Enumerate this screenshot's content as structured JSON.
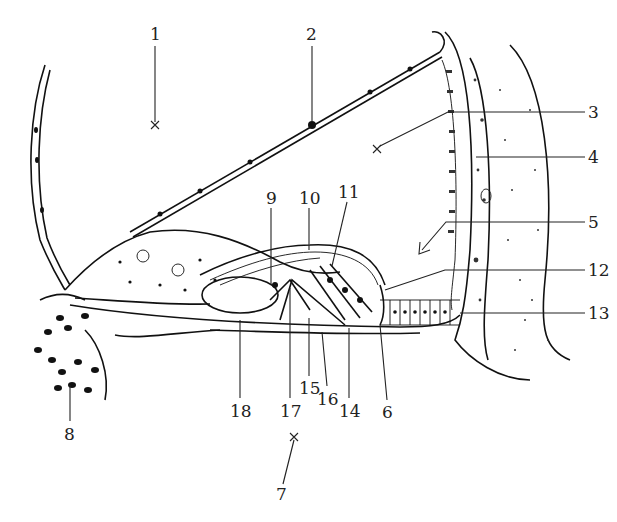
{
  "figure": {
    "background": "#ffffff",
    "ink_color": "#111111",
    "labels": [
      {
        "id": "1",
        "text": "1",
        "x": 155,
        "y": 38,
        "target": [
          155,
          125
        ],
        "marker": "x"
      },
      {
        "id": "2",
        "text": "2",
        "x": 312,
        "y": 38,
        "target": [
          312,
          125
        ],
        "marker": "none"
      },
      {
        "id": "3",
        "text": "3",
        "x": 595,
        "y": 118,
        "target": [
          377,
          148
        ],
        "marker": "x"
      },
      {
        "id": "4",
        "text": "4",
        "x": 595,
        "y": 161,
        "target": [
          478,
          160
        ],
        "marker": "none"
      },
      {
        "id": "5",
        "text": "5",
        "x": 595,
        "y": 226,
        "target": [
          420,
          253
        ],
        "marker": "arrow"
      },
      {
        "id": "6",
        "text": "6",
        "x": 389,
        "y": 418,
        "target": [
          380,
          320
        ],
        "marker": "none"
      },
      {
        "id": "7",
        "text": "7",
        "x": 280,
        "y": 498,
        "target": [
          295,
          436
        ],
        "marker": "x"
      },
      {
        "id": "8",
        "text": "8",
        "x": 70,
        "y": 437,
        "target": [
          70,
          380
        ],
        "marker": "none"
      },
      {
        "id": "9",
        "text": "9",
        "x": 271,
        "y": 202,
        "target": [
          271,
          285
        ],
        "marker": "none"
      },
      {
        "id": "10",
        "text": "10",
        "x": 309,
        "y": 202,
        "target": [
          309,
          252
        ],
        "marker": "none"
      },
      {
        "id": "11",
        "text": "11",
        "x": 345,
        "y": 195,
        "target": [
          330,
          268
        ],
        "marker": "none"
      },
      {
        "id": "12",
        "text": "12",
        "x": 595,
        "y": 275,
        "target": [
          385,
          290
        ],
        "marker": "none"
      },
      {
        "id": "13",
        "text": "13",
        "x": 595,
        "y": 318,
        "target": [
          520,
          318
        ],
        "marker": "none"
      },
      {
        "id": "14",
        "text": "14",
        "x": 349,
        "y": 415,
        "target": [
          349,
          330
        ],
        "marker": "none"
      },
      {
        "id": "15",
        "text": "15",
        "x": 309,
        "y": 392,
        "target": [
          309,
          320
        ],
        "marker": "none"
      },
      {
        "id": "16",
        "text": "16",
        "x": 327,
        "y": 403,
        "target": [
          327,
          335
        ],
        "marker": "none"
      },
      {
        "id": "17",
        "text": "17",
        "x": 290,
        "y": 415,
        "target": [
          290,
          290
        ],
        "marker": "none"
      },
      {
        "id": "18",
        "text": "18",
        "x": 240,
        "y": 415,
        "target": [
          240,
          320
        ],
        "marker": "none"
      }
    ]
  }
}
